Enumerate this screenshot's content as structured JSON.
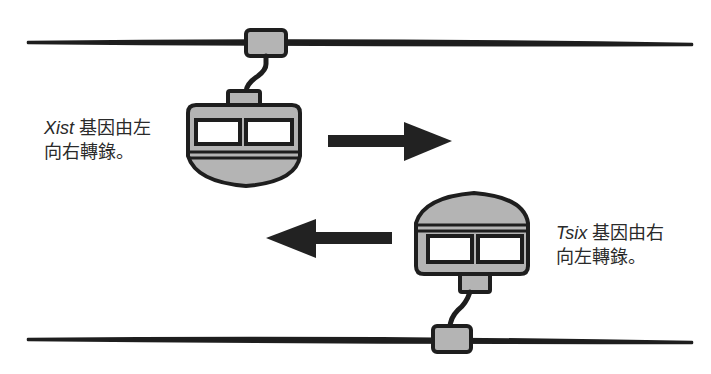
{
  "diagram": {
    "type": "gene transcription direction illustration (cable-car metaphor)",
    "colors": {
      "outline": "#1e1e1e",
      "fill_gray": "#b4b4b4",
      "window": "#ffffff",
      "background": "#ffffff"
    },
    "top_strand": {
      "gene": "Xist",
      "label_line1_rest": " 基因由左",
      "label_line2": "向右轉錄。",
      "arrow_direction": "right"
    },
    "bottom_strand": {
      "gene": "Tsix",
      "label_line1_rest": " 基因由右",
      "label_line2": "向左轉錄。",
      "arrow_direction": "left"
    }
  }
}
